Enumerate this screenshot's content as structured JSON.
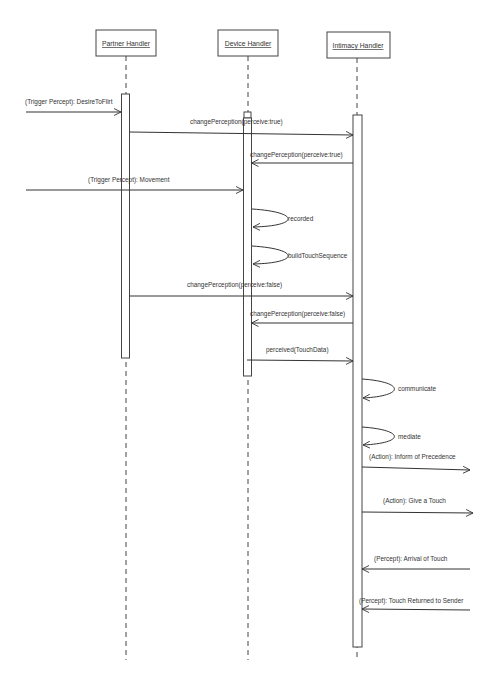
{
  "diagram": {
    "type": "uml-sequence",
    "lifelines": [
      {
        "id": "partner",
        "label": "Partner Handler",
        "x": 126
      },
      {
        "id": "device",
        "label": "Device Handler",
        "x": 248
      },
      {
        "id": "intimacy",
        "label": "Intimacy Handler",
        "x": 357
      }
    ],
    "messages": [
      {
        "label": "(Trigger Percept): DesireToFlirt",
        "from": "external-left",
        "to": "partner",
        "y": 112
      },
      {
        "label": "changePerception(perceive:true)",
        "from": "partner",
        "to": "intimacy",
        "y": 133
      },
      {
        "label": "changePerception(perceive:true)",
        "from": "intimacy",
        "to": "device",
        "y": 163
      },
      {
        "label": "(Trigger Percept): Movement",
        "from": "external-left",
        "to": "device",
        "y": 190
      },
      {
        "label": "recorded",
        "from": "device",
        "to": "device",
        "y": 218,
        "self": true
      },
      {
        "label": "buildTouchSequence",
        "from": "device",
        "to": "device",
        "y": 255,
        "self": true
      },
      {
        "label": "changePerception(perceive:false)",
        "from": "partner",
        "to": "intimacy",
        "y": 296
      },
      {
        "label": "changePerception(perceive:false)",
        "from": "intimacy",
        "to": "device",
        "y": 322
      },
      {
        "label": "perceived(TouchData)",
        "from": "device",
        "to": "intimacy",
        "y": 360
      },
      {
        "label": "communicate",
        "from": "intimacy",
        "to": "intimacy",
        "y": 388,
        "self": true
      },
      {
        "label": "mediate",
        "from": "intimacy",
        "to": "intimacy",
        "y": 427,
        "self": true
      },
      {
        "label": "(Action): Inform of Precedence",
        "from": "intimacy",
        "to": "external-right",
        "y": 469
      },
      {
        "label": "(Action): Give a Touch",
        "from": "intimacy",
        "to": "external-right",
        "y": 513
      },
      {
        "label": "(Percept): Arrival of Touch",
        "from": "external-right",
        "to": "intimacy",
        "y": 569
      },
      {
        "label": "(Percept): Touch Returned to Sender",
        "from": "external-right",
        "to": "intimacy",
        "y": 610
      }
    ]
  },
  "colors": {
    "line": "#333333",
    "background": "#ffffff",
    "faint_text": "#ececec"
  }
}
